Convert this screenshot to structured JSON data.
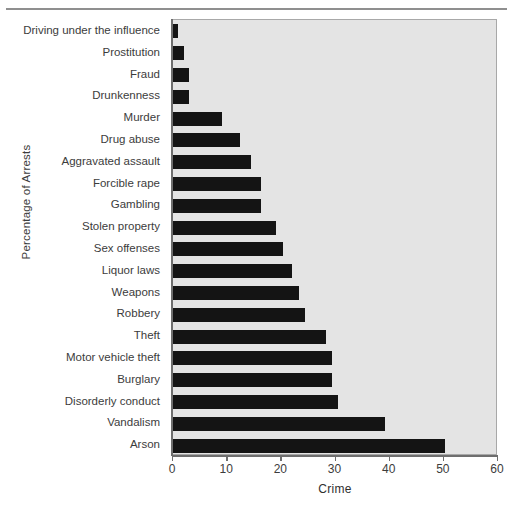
{
  "chart_data": {
    "type": "bar",
    "orientation": "horizontal",
    "title": "",
    "xlabel": "Crime",
    "ylabel": "Percentage of Arrests",
    "xlim": [
      0,
      60
    ],
    "xticks": [
      0,
      10,
      20,
      30,
      40,
      50,
      60
    ],
    "xtick_labels": [
      "0",
      "10",
      "20",
      "30",
      "40",
      "50",
      "60"
    ],
    "grid": false,
    "legend": null,
    "categories": [
      "Driving under the influence",
      "Prostitution",
      "Fraud",
      "Drunkenness",
      "Murder",
      "Drug abuse",
      "Aggravated assault",
      "Forcible rape",
      "Gambling",
      "Stolen property",
      "Sex offenses",
      "Liquor laws",
      "Weapons",
      "Robbery",
      "Theft",
      "Motor vehicle theft",
      "Burglary",
      "Disorderly conduct",
      "Vandalism",
      "Arson"
    ],
    "values": [
      1.0,
      2.1,
      3.0,
      3.0,
      9.1,
      12.4,
      14.4,
      16.3,
      16.3,
      19.0,
      20.3,
      21.9,
      23.2,
      24.4,
      28.3,
      29.3,
      29.3,
      30.5,
      39.2,
      50.2
    ]
  },
  "style": {
    "bar_color": "#141414",
    "plot_background": "#e4e4e4",
    "axis_color": "#6e6e6e",
    "text_color": "#3c3c3c",
    "page_background": "#ffffff"
  }
}
